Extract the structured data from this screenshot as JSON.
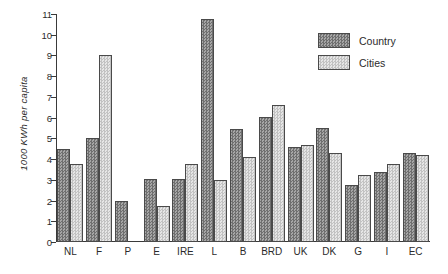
{
  "chart_data": {
    "type": "bar",
    "title": "",
    "xlabel": "",
    "ylabel": "1000 KWh per capita",
    "ylim": [
      0,
      11
    ],
    "ytick_labels": [
      "0",
      "1",
      "2",
      "3",
      "4",
      "5",
      "6",
      "7",
      "8",
      "9",
      "10",
      "11"
    ],
    "grid": false,
    "legend_position": "top-right",
    "categories": [
      "NL",
      "F",
      "P",
      "E",
      "IRE",
      "L",
      "B",
      "BRD",
      "UK",
      "DK",
      "G",
      "I",
      "EC"
    ],
    "series": [
      {
        "name": "Country",
        "color": "#8e8e8e",
        "values": [
          4.5,
          5.0,
          2.0,
          3.05,
          3.05,
          10.75,
          5.45,
          6.05,
          4.6,
          5.5,
          2.75,
          3.4,
          4.3
        ]
      },
      {
        "name": "Cities",
        "color": "#d2d2d2",
        "values": [
          3.75,
          9.0,
          null,
          1.75,
          3.75,
          3.0,
          4.1,
          6.6,
          4.7,
          4.3,
          3.25,
          3.75,
          4.2
        ]
      }
    ]
  },
  "legend": {
    "items": [
      {
        "label": "Country",
        "key": "country"
      },
      {
        "label": "Cities",
        "key": "cities"
      }
    ]
  }
}
